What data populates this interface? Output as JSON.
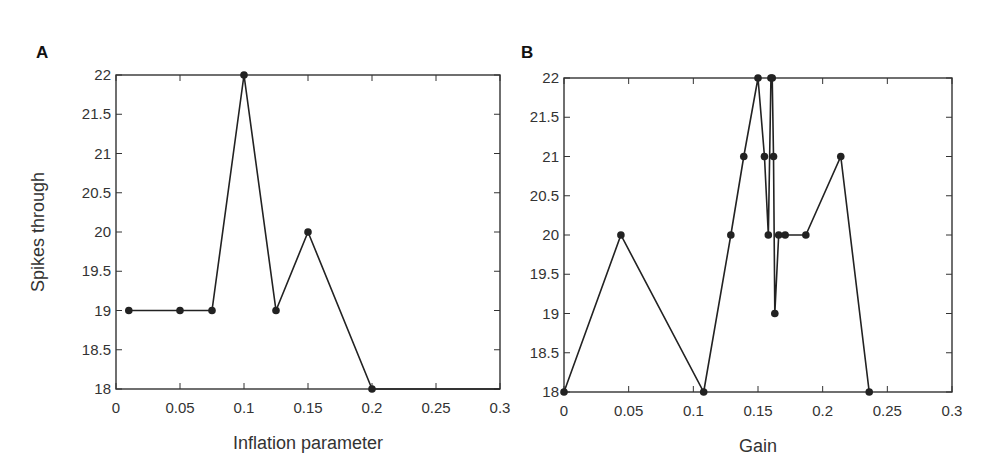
{
  "chart_data": [
    {
      "panel": "A",
      "type": "line",
      "title": "",
      "xlabel": "Inflation parameter",
      "ylabel": "Spikes through",
      "xlim": [
        0,
        0.3
      ],
      "ylim": [
        18,
        22
      ],
      "xticks": [
        "0",
        "0.05",
        "0.1",
        "0.15",
        "0.2",
        "0.25",
        "0.3"
      ],
      "yticks": [
        "18",
        "18.5",
        "19",
        "19.5",
        "20",
        "20.5",
        "21",
        "21.5",
        "22"
      ],
      "grid": false,
      "x": [
        0.01,
        0.05,
        0.075,
        0.1,
        0.125,
        0.15,
        0.2
      ],
      "values": [
        19,
        19,
        19,
        22,
        19,
        20,
        18
      ],
      "line_extends_to": [
        0.3,
        18
      ]
    },
    {
      "panel": "B",
      "type": "line",
      "title": "",
      "xlabel": "Gain",
      "ylabel": "",
      "xlim": [
        0,
        0.3
      ],
      "ylim": [
        18,
        22
      ],
      "xticks": [
        "0",
        "0.05",
        "0.1",
        "0.15",
        "0.2",
        "0.25",
        "0.3"
      ],
      "yticks": [
        "18",
        "18.5",
        "19",
        "19.5",
        "20",
        "20.5",
        "21",
        "21.5",
        "22"
      ],
      "grid": false,
      "x": [
        0,
        0.044,
        0.108,
        0.129,
        0.139,
        0.15,
        0.155,
        0.158,
        0.16,
        0.161,
        0.162,
        0.163,
        0.166,
        0.171,
        0.187,
        0.214,
        0.236
      ],
      "values": [
        18,
        20,
        18,
        20,
        21,
        22,
        21,
        20,
        22,
        22,
        21,
        19,
        20,
        20,
        20,
        21,
        18
      ]
    }
  ],
  "panels": {
    "a": {
      "label": "A",
      "xlabel": "Inflation parameter",
      "ylabel": "Spikes through"
    },
    "b": {
      "label": "B",
      "xlabel": "Gain"
    }
  }
}
